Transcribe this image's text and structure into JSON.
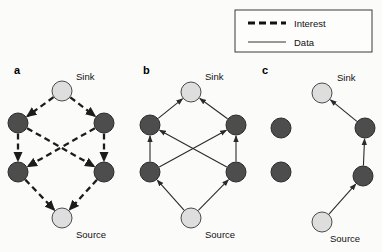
{
  "figure": {
    "type": "directed-graph-diagram",
    "width": 382,
    "height": 252,
    "background_color": "#fbfbfa"
  },
  "legend": {
    "position": "top-right",
    "border_color": "#3a3a3a",
    "entries": [
      {
        "label": "Interest",
        "line_style": "dashed",
        "color": "#111111"
      },
      {
        "label": "Data",
        "line_style": "solid",
        "color": "#333333"
      }
    ]
  },
  "colors": {
    "node_dark": "#4d4d4d",
    "node_light": "#dedede",
    "node_outline": "#2b2b2b",
    "edge_interest": "#1c1c1c",
    "edge_data": "#2a2a2a",
    "text": "#111111"
  },
  "labels": {
    "sink": "Sink",
    "source": "Source"
  },
  "panels": [
    {
      "letter": "a",
      "letter_pos": [
        14,
        74
      ],
      "edge_style": "interest",
      "sink_label_pos": [
        76,
        80
      ],
      "source_label_pos": [
        76,
        238
      ],
      "nodes": [
        {
          "id": "sink",
          "role": "sink",
          "shade": "light",
          "cx": 62,
          "cy": 91,
          "r": 10
        },
        {
          "id": "ul",
          "role": "relay",
          "shade": "dark",
          "cx": 18,
          "cy": 123,
          "r": 10
        },
        {
          "id": "ur",
          "role": "relay",
          "shade": "dark",
          "cx": 104,
          "cy": 123,
          "r": 10
        },
        {
          "id": "ll",
          "role": "relay",
          "shade": "dark",
          "cx": 18,
          "cy": 172,
          "r": 10
        },
        {
          "id": "lr",
          "role": "relay",
          "shade": "dark",
          "cx": 104,
          "cy": 172,
          "r": 10
        },
        {
          "id": "source",
          "role": "source",
          "shade": "light",
          "cx": 62,
          "cy": 218,
          "r": 10
        }
      ],
      "edges": [
        {
          "from": "sink",
          "to": "ul"
        },
        {
          "from": "sink",
          "to": "ur"
        },
        {
          "from": "ul",
          "to": "ll"
        },
        {
          "from": "ur",
          "to": "lr"
        },
        {
          "from": "ul",
          "to": "lr"
        },
        {
          "from": "ur",
          "to": "ll"
        },
        {
          "from": "ll",
          "to": "source"
        },
        {
          "from": "lr",
          "to": "source"
        }
      ]
    },
    {
      "letter": "b",
      "letter_pos": [
        143,
        74
      ],
      "edge_style": "data",
      "sink_label_pos": [
        205,
        80
      ],
      "source_label_pos": [
        205,
        238
      ],
      "nodes": [
        {
          "id": "sink",
          "role": "sink",
          "shade": "light",
          "cx": 191,
          "cy": 92,
          "r": 10
        },
        {
          "id": "ul",
          "role": "relay",
          "shade": "dark",
          "cx": 150,
          "cy": 125,
          "r": 10
        },
        {
          "id": "ur",
          "role": "relay",
          "shade": "dark",
          "cx": 236,
          "cy": 125,
          "r": 10
        },
        {
          "id": "ll",
          "role": "relay",
          "shade": "dark",
          "cx": 150,
          "cy": 172,
          "r": 10
        },
        {
          "id": "lr",
          "role": "relay",
          "shade": "dark",
          "cx": 236,
          "cy": 172,
          "r": 10
        },
        {
          "id": "source",
          "role": "source",
          "shade": "light",
          "cx": 191,
          "cy": 218,
          "r": 10
        }
      ],
      "edges": [
        {
          "from": "source",
          "to": "ll"
        },
        {
          "from": "source",
          "to": "lr"
        },
        {
          "from": "ll",
          "to": "ul"
        },
        {
          "from": "lr",
          "to": "ur"
        },
        {
          "from": "ll",
          "to": "ur"
        },
        {
          "from": "lr",
          "to": "ul"
        },
        {
          "from": "ul",
          "to": "sink"
        },
        {
          "from": "ur",
          "to": "sink"
        }
      ]
    },
    {
      "letter": "c",
      "letter_pos": [
        262,
        74
      ],
      "edge_style": "data",
      "sink_label_pos": [
        337,
        81
      ],
      "source_label_pos": [
        330,
        242
      ],
      "nodes": [
        {
          "id": "sink",
          "role": "sink",
          "shade": "light",
          "cx": 322,
          "cy": 93,
          "r": 10
        },
        {
          "id": "ul",
          "role": "relay",
          "shade": "dark",
          "cx": 281,
          "cy": 128,
          "r": 10
        },
        {
          "id": "ur",
          "role": "relay",
          "shade": "dark",
          "cx": 365,
          "cy": 128,
          "r": 10
        },
        {
          "id": "ll",
          "role": "relay",
          "shade": "dark",
          "cx": 281,
          "cy": 172,
          "r": 10
        },
        {
          "id": "lr",
          "role": "relay",
          "shade": "dark",
          "cx": 363,
          "cy": 176,
          "r": 10
        },
        {
          "id": "source",
          "role": "source",
          "shade": "light",
          "cx": 322,
          "cy": 222,
          "r": 10
        }
      ],
      "edges": [
        {
          "from": "source",
          "to": "lr"
        },
        {
          "from": "lr",
          "to": "ur"
        },
        {
          "from": "ur",
          "to": "sink"
        }
      ]
    }
  ]
}
